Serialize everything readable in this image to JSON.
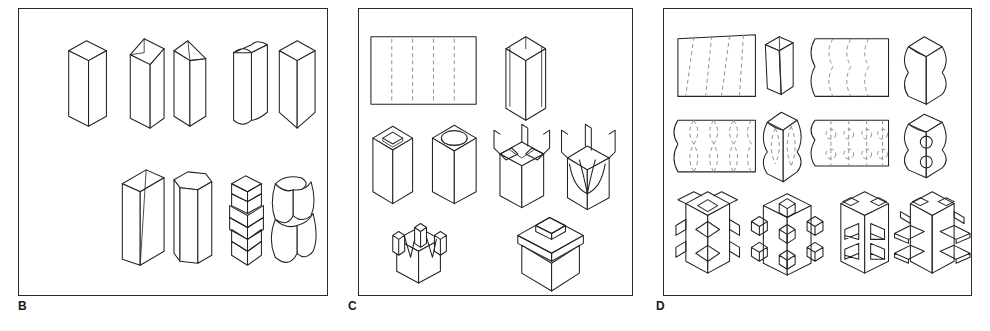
{
  "sheet": {
    "kind": "technical-illustration-plate",
    "background_color": "#ffffff",
    "line_color": "#232323",
    "fold_line_color": "#8c8c8c",
    "panel_count": 3
  },
  "panels": [
    {
      "id": "B",
      "label": "B",
      "caption_position": "below-left",
      "description": "Isometric drawings of solid square-section columns with varied profile modifications",
      "rows": [
        {
          "row": 1,
          "items": [
            {
              "name": "plain-square-column",
              "note": "straight square prism, vertical"
            },
            {
              "name": "bevel-top-column",
              "note": "square prism with sloped chamfered top"
            },
            {
              "name": "knife-edge-column",
              "note": "prism with angled wedge top and tapered edge"
            },
            {
              "name": "concave-flute-column",
              "note": "prism with concave scalloped top and bottom ends"
            },
            {
              "name": "point-end-column",
              "note": "prism tapering to a point at the base"
            }
          ]
        },
        {
          "row": 2,
          "items": [
            {
              "name": "tapered-slab-column",
              "note": "flat slab narrowing toward the base"
            },
            {
              "name": "hexagonal-column",
              "note": "six-sided prism with hexagonal top face"
            },
            {
              "name": "chevron-stack-column",
              "note": "column of stacked chevron/zigzag segments"
            },
            {
              "name": "bulbous-round-column",
              "note": "column of two stacked rounded lobes"
            }
          ]
        }
      ]
    },
    {
      "id": "C",
      "label": "C",
      "caption_position": "below-left",
      "description": "Flat rectangular net with straight fold lines and the folded box forms derived from it",
      "rows": [
        {
          "row": 1,
          "items": [
            {
              "name": "flat-net-straight-folds",
              "note": "rectangle with four vertical dashed fold lines forming five panels"
            },
            {
              "name": "folded-open-box",
              "note": "net folded into an open square tube"
            }
          ]
        },
        {
          "row": 2,
          "items": [
            {
              "name": "box-diamond-aperture",
              "note": "box with diamond-shaped opening in the top"
            },
            {
              "name": "box-circular-aperture",
              "note": "box with circular opening in the top"
            },
            {
              "name": "box-splayed-flaps",
              "note": "box with angular flaps peeled outward at the rim"
            },
            {
              "name": "box-curled-flaps",
              "note": "box with curved tongues curling outward and upward"
            }
          ]
        },
        {
          "row": 3,
          "items": [
            {
              "name": "box-v-notched-prongs",
              "note": "box with V-notches cut between four upright prongs"
            },
            {
              "name": "box-raised-plinth-lid",
              "note": "box capped by a stepped raised rectangular plinth"
            }
          ]
        }
      ]
    },
    {
      "id": "D",
      "label": "D",
      "caption_position": "below-left",
      "description": "Nets with curved and patterned fold lines producing sculpted columns, plus columns with projecting blocks",
      "rows": [
        {
          "row": 1,
          "items": [
            {
              "name": "net-slanted-folds",
              "note": "trapezoidal net with slanted dashed fold lines"
            },
            {
              "name": "tapered-twist-column",
              "note": "column tapering from the slanted-fold net"
            },
            {
              "name": "net-wavy-folds",
              "note": "net with wavy dashed fold lines and scalloped side edges"
            },
            {
              "name": "undulating-column",
              "note": "column with wavy undulating vertical silhouette"
            }
          ]
        },
        {
          "row": 2,
          "items": [
            {
              "name": "net-diamond-lattice-folds",
              "note": "net with diamond-lattice dashed fold pattern"
            },
            {
              "name": "faceted-diamond-column",
              "note": "column with stacked diamond facets"
            },
            {
              "name": "net-circle-folds",
              "note": "net with dashed fold lines interrupted by circles"
            },
            {
              "name": "sphere-bump-column",
              "note": "column with two spherical bulges on the face"
            }
          ]
        },
        {
          "row": 3,
          "items": [
            {
              "name": "column-folded-wing-tabs",
              "note": "column with folded wing tabs projecting from the corners"
            },
            {
              "name": "column-cube-studs",
              "note": "column with cube-shaped studs on faces and edges"
            },
            {
              "name": "column-recessed-panels",
              "note": "column with rectangular recessed panels on two faces"
            },
            {
              "name": "column-shelf-tabs",
              "note": "column with shelf-like tabs projecting at several levels"
            }
          ]
        }
      ]
    }
  ]
}
